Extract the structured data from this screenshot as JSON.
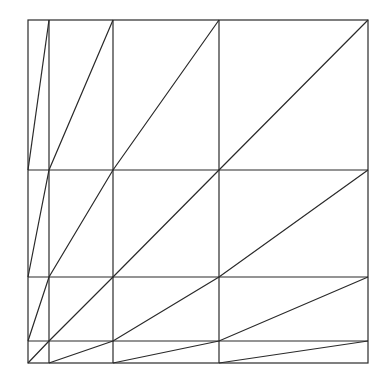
{
  "diagram": {
    "stroke_color": "#2a2a2a",
    "background": "#ffffff",
    "frame": {
      "x1": 28,
      "y1": 20,
      "x2": 368,
      "y2": 363
    },
    "vertical_lines_x": [
      49,
      113,
      219
    ],
    "horizontal_lines_y": [
      170,
      277,
      341
    ],
    "diagonals": [
      [
        [
          28,
          363
        ],
        [
          49,
          341
        ],
        [
          113,
          277
        ],
        [
          219,
          170
        ],
        [
          368,
          20
        ]
      ],
      [
        [
          49,
          363
        ],
        [
          113,
          341
        ],
        [
          219,
          277
        ],
        [
          368,
          170
        ]
      ],
      [
        [
          113,
          363
        ],
        [
          219,
          341
        ],
        [
          368,
          277
        ]
      ],
      [
        [
          219,
          363
        ],
        [
          368,
          341
        ]
      ],
      [
        [
          28,
          341
        ],
        [
          49,
          277
        ],
        [
          113,
          170
        ],
        [
          219,
          20
        ]
      ],
      [
        [
          28,
          277
        ],
        [
          49,
          170
        ],
        [
          113,
          20
        ]
      ],
      [
        [
          28,
          170
        ],
        [
          49,
          20
        ]
      ]
    ]
  }
}
